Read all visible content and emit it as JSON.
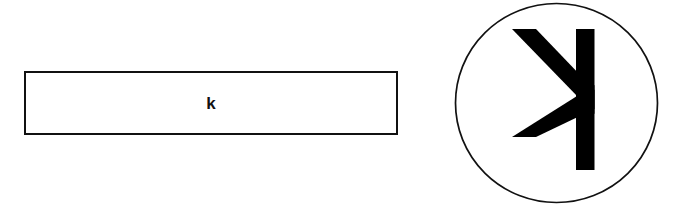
{
  "figure": {
    "background_color": "#ffffff",
    "stroke_color": "#111111",
    "fill_color": "#000000",
    "width": 676,
    "height": 224
  },
  "bar": {
    "label": "k",
    "shape": "rectangle",
    "fill": "#ffffff",
    "border_color": "#111111",
    "border_width": 2
  },
  "circle": {
    "shape": "ellipse",
    "fill": "#ffffff",
    "outline_color": "#111111",
    "outline_width": 1.6,
    "glyph": {
      "name": "mirrored-k-glyph",
      "character": "k",
      "orientation": "mirrored-horizontally",
      "fill": "#000000"
    }
  }
}
